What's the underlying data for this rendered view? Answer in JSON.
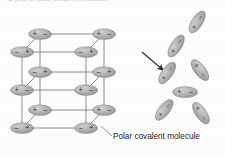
{
  "figure": {
    "title_top": "Crystal of polar covalent molecules",
    "label_molecule": "Polar covalent molecule",
    "charge_positive": "+",
    "charge_negative": "–",
    "colors": {
      "molecule_fill": "#a9a9a9",
      "molecule_fill_light": "#c0c0c0",
      "molecule_stroke": "#7a7a7a",
      "bond_line": "#808080",
      "arrow": "#2b2b2b",
      "leader_line": "#8a8a8a",
      "text": "#1c1c1c",
      "background": "#fdfdfd"
    }
  },
  "lattice": {
    "name": "crystal-lattice",
    "description": "Three-dimensional cubic array of polar covalent molecules held in fixed orientation",
    "rows": 3,
    "columns": 2,
    "depth_layers": 2,
    "molecules": [
      {
        "id": "m01",
        "cx": 40,
        "cy": 34,
        "angle": 0,
        "order": "plus-minus",
        "layer": "front"
      },
      {
        "id": "m02",
        "cx": 104,
        "cy": 34,
        "angle": 0,
        "order": "plus-minus",
        "layer": "front"
      },
      {
        "id": "m03",
        "cx": 22,
        "cy": 52,
        "angle": 0,
        "order": "minus-plus",
        "layer": "back"
      },
      {
        "id": "m04",
        "cx": 86,
        "cy": 52,
        "angle": 0,
        "order": "minus-plus",
        "layer": "back"
      },
      {
        "id": "m05",
        "cx": 40,
        "cy": 72,
        "angle": 0,
        "order": "minus-plus",
        "layer": "front"
      },
      {
        "id": "m06",
        "cx": 104,
        "cy": 72,
        "angle": 0,
        "order": "minus-plus",
        "layer": "front"
      },
      {
        "id": "m07",
        "cx": 22,
        "cy": 90,
        "angle": 0,
        "order": "plus-minus",
        "layer": "back"
      },
      {
        "id": "m08",
        "cx": 86,
        "cy": 90,
        "angle": 0,
        "order": "plus-minus",
        "layer": "back"
      },
      {
        "id": "m09",
        "cx": 40,
        "cy": 110,
        "angle": 0,
        "order": "plus-minus",
        "layer": "front"
      },
      {
        "id": "m10",
        "cx": 104,
        "cy": 110,
        "angle": 0,
        "order": "plus-minus",
        "layer": "front"
      },
      {
        "id": "m11",
        "cx": 22,
        "cy": 128,
        "angle": 0,
        "order": "minus-plus",
        "layer": "back"
      },
      {
        "id": "m12",
        "cx": 86,
        "cy": 128,
        "angle": 0,
        "order": "minus-plus",
        "layer": "back"
      }
    ],
    "bonds": [
      {
        "x1": 40,
        "y1": 34,
        "x2": 104,
        "y2": 34
      },
      {
        "x1": 22,
        "y1": 52,
        "x2": 86,
        "y2": 52
      },
      {
        "x1": 40,
        "y1": 72,
        "x2": 104,
        "y2": 72
      },
      {
        "x1": 22,
        "y1": 90,
        "x2": 86,
        "y2": 90
      },
      {
        "x1": 40,
        "y1": 110,
        "x2": 104,
        "y2": 110
      },
      {
        "x1": 22,
        "y1": 128,
        "x2": 86,
        "y2": 128
      },
      {
        "x1": 40,
        "y1": 34,
        "x2": 40,
        "y2": 72
      },
      {
        "x1": 40,
        "y1": 72,
        "x2": 40,
        "y2": 110
      },
      {
        "x1": 104,
        "y1": 34,
        "x2": 104,
        "y2": 72
      },
      {
        "x1": 104,
        "y1": 72,
        "x2": 104,
        "y2": 110
      },
      {
        "x1": 22,
        "y1": 52,
        "x2": 22,
        "y2": 90
      },
      {
        "x1": 22,
        "y1": 90,
        "x2": 22,
        "y2": 128
      },
      {
        "x1": 86,
        "y1": 52,
        "x2": 86,
        "y2": 90
      },
      {
        "x1": 86,
        "y1": 90,
        "x2": 86,
        "y2": 128
      },
      {
        "x1": 40,
        "y1": 34,
        "x2": 22,
        "y2": 52
      },
      {
        "x1": 104,
        "y1": 34,
        "x2": 86,
        "y2": 52
      },
      {
        "x1": 40,
        "y1": 72,
        "x2": 22,
        "y2": 90
      },
      {
        "x1": 104,
        "y1": 72,
        "x2": 86,
        "y2": 90
      },
      {
        "x1": 40,
        "y1": 110,
        "x2": 22,
        "y2": 128
      },
      {
        "x1": 104,
        "y1": 110,
        "x2": 86,
        "y2": 128
      }
    ]
  },
  "cluster": {
    "name": "dissociated-cluster",
    "description": "Free polar covalent molecules with rotational freedom arranged around a central molecule",
    "molecules": [
      {
        "id": "c01",
        "cx": 197,
        "cy": 22,
        "angle": -58,
        "order": "plus-minus"
      },
      {
        "id": "c02",
        "cx": 176,
        "cy": 46,
        "angle": -58,
        "order": "plus-minus"
      },
      {
        "id": "c03",
        "cx": 167,
        "cy": 73,
        "angle": -55,
        "order": "plus-minus"
      },
      {
        "id": "c04",
        "cx": 200,
        "cy": 70,
        "angle": 52,
        "order": "plus-minus"
      },
      {
        "id": "c05",
        "cx": 185,
        "cy": 92,
        "angle": 0,
        "order": "plus-minus"
      },
      {
        "id": "c06",
        "cx": 164,
        "cy": 110,
        "angle": -52,
        "order": "plus-minus"
      },
      {
        "id": "c07",
        "cx": 201,
        "cy": 113,
        "angle": 55,
        "order": "plus-minus"
      }
    ]
  },
  "arrow": {
    "name": "transition-arrow",
    "x1": 142,
    "y1": 52,
    "x2": 163,
    "y2": 70,
    "direction": "down-right"
  },
  "leader": {
    "name": "label-leader-line",
    "x1": 101,
    "y1": 126,
    "x2": 112,
    "y2": 136
  }
}
